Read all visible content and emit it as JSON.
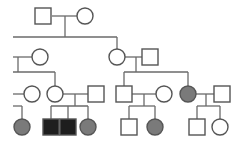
{
  "colors": {
    "line": "#6a6a6a",
    "outline": "#555555",
    "unaffected_fill": "#ffffff",
    "affected_female_fill": "#7a7a7a",
    "affected_male_fill": "#1e1e1e"
  },
  "legend_semantics": {
    "square": "male",
    "circle": "female",
    "filled": "affected",
    "open": "unaffected"
  },
  "generations": [
    {
      "label": "I",
      "individuals": [
        {
          "id": "I-1",
          "sex": "male",
          "affected": false
        },
        {
          "id": "I-2",
          "sex": "female",
          "affected": false
        }
      ]
    },
    {
      "label": "II",
      "individuals": [
        {
          "id": "II-1",
          "sex": "female",
          "affected": false
        },
        {
          "id": "II-2",
          "sex": "female",
          "affected": false
        },
        {
          "id": "II-3",
          "sex": "male",
          "affected": false
        }
      ]
    },
    {
      "label": "III",
      "individuals": [
        {
          "id": "III-1",
          "sex": "female",
          "affected": false
        },
        {
          "id": "III-2",
          "sex": "female",
          "affected": false
        },
        {
          "id": "III-3",
          "sex": "male",
          "affected": false
        },
        {
          "id": "III-4",
          "sex": "male",
          "affected": false
        },
        {
          "id": "III-5",
          "sex": "female",
          "affected": false
        },
        {
          "id": "III-6",
          "sex": "female",
          "affected": true
        },
        {
          "id": "III-7",
          "sex": "male",
          "affected": false
        }
      ]
    },
    {
      "label": "IV",
      "individuals": [
        {
          "id": "IV-1",
          "sex": "female",
          "affected": true
        },
        {
          "id": "IV-2",
          "sex": "male",
          "affected": true
        },
        {
          "id": "IV-3",
          "sex": "male",
          "affected": true
        },
        {
          "id": "IV-4",
          "sex": "female",
          "affected": true
        },
        {
          "id": "IV-5",
          "sex": "male",
          "affected": false
        },
        {
          "id": "IV-6",
          "sex": "female",
          "affected": true
        },
        {
          "id": "IV-7",
          "sex": "male",
          "affected": false
        },
        {
          "id": "IV-8",
          "sex": "female",
          "affected": false
        }
      ]
    }
  ],
  "unions": [
    {
      "partners": [
        "I-1",
        "I-2"
      ],
      "children": [
        "II-2"
      ]
    },
    {
      "partners": [
        "II-2",
        "II-3"
      ],
      "children": [
        "III-4",
        "III-6"
      ]
    },
    {
      "partners": [
        "III-2",
        "III-3"
      ],
      "children": [
        "IV-2",
        "IV-3",
        "IV-4"
      ]
    },
    {
      "partners": [
        "III-4",
        "III-5"
      ],
      "children": [
        "IV-5",
        "IV-6"
      ]
    },
    {
      "partners": [
        "III-6",
        "III-7"
      ],
      "children": [
        "IV-7",
        "IV-8"
      ]
    }
  ]
}
